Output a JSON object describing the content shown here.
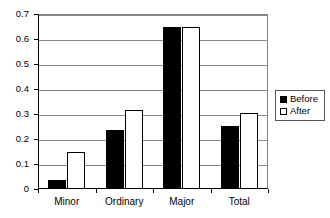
{
  "chart_data": {
    "type": "bar",
    "title": "",
    "xlabel": "",
    "ylabel": "",
    "categories": [
      "Minor",
      "Ordinary",
      "Major",
      "Total"
    ],
    "series": [
      {
        "name": "Before",
        "color": "#000000",
        "fill": "solid",
        "values": [
          0.037,
          0.237,
          0.648,
          0.254
        ]
      },
      {
        "name": "After",
        "color": "#ffffff",
        "fill": "outline",
        "values": [
          0.148,
          0.317,
          0.648,
          0.306
        ]
      }
    ],
    "ylim": [
      0,
      0.7
    ],
    "ytick_values": [
      0,
      0.1,
      0.2,
      0.3,
      0.4,
      0.5,
      0.6,
      0.7
    ],
    "ytick_labels": [
      "0",
      "0.1",
      "0.2",
      "0.3",
      "0.4",
      "0.5",
      "0.6",
      "0.7"
    ],
    "grid": "horizontal",
    "legend_position": "right-outside"
  },
  "legend": {
    "items": [
      {
        "label": "Before"
      },
      {
        "label": "After"
      }
    ]
  }
}
